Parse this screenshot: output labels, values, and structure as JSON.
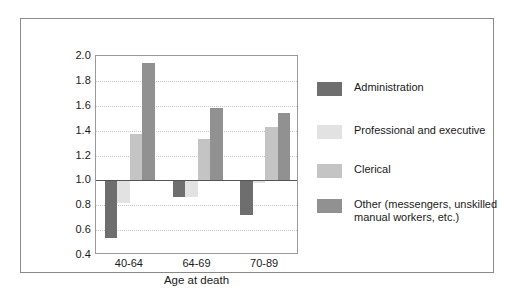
{
  "chart_data": {
    "type": "bar",
    "title": "",
    "subtitle": "",
    "xlabel": "Age at death",
    "ylabel": "",
    "categories": [
      "40-64",
      "64-69",
      "70-89"
    ],
    "ylim": [
      0.4,
      2.0
    ],
    "ytick_step": 0.2,
    "yticks": [
      "2.0",
      "1.8",
      "1.6",
      "1.4",
      "1.2",
      "1.0",
      "0.8",
      "0.6",
      "0.4"
    ],
    "ytick_values": [
      2.0,
      1.8,
      1.6,
      1.4,
      1.2,
      1.0,
      0.8,
      0.6,
      0.4
    ],
    "reference_line": 1.0,
    "grid": "horizontal-dotted",
    "legend_position": "right",
    "series": [
      {
        "name": "Administration",
        "color": "#6e6e6e",
        "values": [
          0.54,
          0.87,
          0.72
        ]
      },
      {
        "name": "Professional and executive",
        "color": "#e2e2e2",
        "values": [
          0.82,
          0.87,
          0.98
        ]
      },
      {
        "name": "Clerical",
        "color": "#c4c4c4",
        "values": [
          1.37,
          1.33,
          1.43
        ]
      },
      {
        "name": "Other (messengers, unskilled\nmanual workers, etc.)",
        "color": "#919191",
        "values": [
          1.94,
          1.58,
          1.54
        ]
      }
    ]
  },
  "legend": {
    "items": [
      {
        "label": "Administration",
        "color": "#6e6e6e"
      },
      {
        "label": "Professional and executive",
        "color": "#e2e2e2"
      },
      {
        "label": "Clerical",
        "color": "#c4c4c4"
      },
      {
        "label": "Other (messengers, unskilled\nmanual workers, etc.)",
        "color": "#919191"
      }
    ]
  }
}
